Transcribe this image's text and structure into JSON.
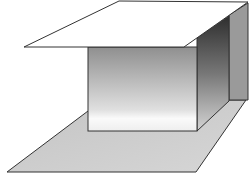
{
  "diagram": {
    "type": "3d-geometric-shapes",
    "elements": [
      {
        "name": "top-plane",
        "fill": "#ffffff"
      },
      {
        "name": "box-front-face",
        "fill_gradient": [
          "#8f8f8f",
          "#f4f4f4"
        ]
      },
      {
        "name": "box-side-face",
        "fill_gradient": [
          "#3a3a3a",
          "#c8c8c8"
        ]
      },
      {
        "name": "back-wall",
        "fill": "#9a9a9a"
      },
      {
        "name": "floor-plane",
        "fill": "#cccccc"
      }
    ],
    "stroke_color": "#333333"
  }
}
